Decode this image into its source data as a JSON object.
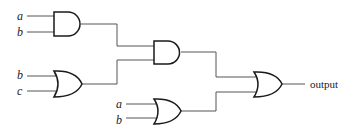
{
  "diagram": {
    "type": "logic-circuit",
    "gates": [
      {
        "id": "and1",
        "kind": "AND",
        "inputs": [
          "a",
          "b"
        ]
      },
      {
        "id": "or1",
        "kind": "OR",
        "inputs": [
          "b",
          "c"
        ]
      },
      {
        "id": "and2",
        "kind": "AND",
        "inputs": [
          "and1",
          "or1"
        ]
      },
      {
        "id": "or2",
        "kind": "OR",
        "inputs": [
          "a",
          "b"
        ]
      },
      {
        "id": "or3",
        "kind": "OR",
        "inputs": [
          "and2",
          "or2"
        ],
        "output": "output"
      }
    ],
    "labels": {
      "and1_in1": "a",
      "and1_in2": "b",
      "or1_in1": "b",
      "or1_in2": "c",
      "or2_in1": "a",
      "or2_in2": "b",
      "output": "output"
    },
    "colors": {
      "gate_stroke": "#1a1a1a",
      "wire": "#555555",
      "background": "#ffffff"
    }
  }
}
